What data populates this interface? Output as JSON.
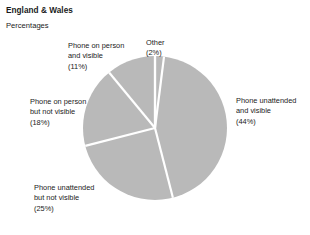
{
  "header": {
    "title": "England & Wales",
    "subtitle": "Percentages"
  },
  "colors": {
    "slice_fill": "#b9b9b9",
    "slice_divider": "#ffffff",
    "text": "#1a1a1a",
    "background": "#ffffff"
  },
  "labels": {
    "other": {
      "line1": "Other",
      "line2": "(2%)"
    },
    "person_visible": {
      "line1": "Phone on person",
      "line2": "and visible",
      "line3": "(11%)"
    },
    "unattended_visible": {
      "line1": "Phone unattended",
      "line2": "and visible",
      "line3": "(44%)"
    },
    "person_not_visible": {
      "line1": "Phone on person",
      "line2": "but not visible",
      "line3": "(18%)"
    },
    "unattended_not_visible": {
      "line1": "Phone unattended",
      "line2": "but not visible",
      "line3": "(25%)"
    }
  },
  "chart_data": {
    "type": "pie",
    "title": "England & Wales",
    "subtitle": "Percentages",
    "unit": "Percentages",
    "categories": [
      "Other",
      "Phone unattended and visible",
      "Phone unattended but not visible",
      "Phone on person but not visible",
      "Phone on person and visible"
    ],
    "values": [
      2,
      44,
      25,
      18,
      11
    ],
    "labels": [
      "Other (2%)",
      "Phone unattended and visible (44%)",
      "Phone unattended but not visible (25%)",
      "Phone on person but not visible (18%)",
      "Phone on person and visible (11%)"
    ],
    "total": 100,
    "start_angle_deg": 0,
    "direction": "clockwise",
    "legend": "none",
    "grid": false,
    "slice_color": "#b9b9b9",
    "divider_color": "#ffffff"
  }
}
